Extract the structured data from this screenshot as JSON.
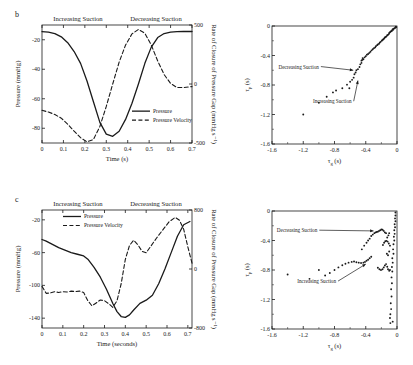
{
  "figure": {
    "panels": [
      {
        "id": "b",
        "label": "b",
        "headers": {
          "left": "Increasing Suction",
          "right": "Decreasing Suction"
        },
        "legend": [
          {
            "label": "Pressure",
            "style": "solid"
          },
          {
            "label": "Pressure Velocity",
            "style": "dashed"
          }
        ]
      },
      {
        "id": "c",
        "label": "c",
        "headers": {
          "left": "Increasing Suction",
          "right": "Decreasing Suction"
        },
        "legend": [
          {
            "label": "Pressure",
            "style": "solid"
          },
          {
            "label": "Pressure Velocity",
            "style": "dashed"
          }
        ]
      }
    ]
  },
  "chart_data": [
    {
      "id": "panel-b-timeseries",
      "type": "line",
      "title": "",
      "xlabel": "Time (s)",
      "ylabel": "Pressure (mmHg)",
      "y2label": "Rate of Closure of Pressure Gap (mmHg s⁻¹)",
      "xlim": [
        0,
        0.7
      ],
      "ylim": [
        -90,
        -10
      ],
      "y2lim": [
        -500,
        500
      ],
      "xticks": [
        0,
        0.1,
        0.2,
        0.3,
        0.4,
        0.5,
        0.6,
        0.7
      ],
      "xticklabels": [
        "0",
        "0.1",
        "0.2",
        "0.3",
        "0.4",
        "0.5",
        "0.6",
        "0.7"
      ],
      "yticks": [
        -20,
        -40,
        -60,
        -80
      ],
      "yticklabels": [
        "-20",
        "-40",
        "-60",
        "-80"
      ],
      "y2ticks": [
        500,
        0,
        -500
      ],
      "y2ticklabels": [
        "500",
        "0",
        "-500"
      ],
      "grid": false,
      "legend_position": "lower-right",
      "series": [
        {
          "name": "Pressure",
          "style": "solid",
          "axis": "left",
          "x": [
            0.0,
            0.03,
            0.06,
            0.09,
            0.12,
            0.15,
            0.18,
            0.21,
            0.24,
            0.27,
            0.3,
            0.33,
            0.36,
            0.39,
            0.42,
            0.45,
            0.48,
            0.51,
            0.54,
            0.57,
            0.6,
            0.63,
            0.66,
            0.7
          ],
          "y": [
            -14.5,
            -14.8,
            -15.8,
            -18.0,
            -22.0,
            -28.0,
            -36.0,
            -48.0,
            -62.0,
            -76.0,
            -84.0,
            -85.5,
            -82.0,
            -74.0,
            -63.0,
            -50.0,
            -36.0,
            -25.0,
            -18.5,
            -15.8,
            -14.8,
            -14.5,
            -14.4,
            -14.4
          ]
        },
        {
          "name": "Pressure Velocity",
          "style": "dashed",
          "axis": "right",
          "x": [
            0.0,
            0.03,
            0.06,
            0.09,
            0.12,
            0.15,
            0.18,
            0.21,
            0.24,
            0.27,
            0.3,
            0.33,
            0.36,
            0.39,
            0.42,
            0.45,
            0.48,
            0.51,
            0.54,
            0.57,
            0.6,
            0.63,
            0.66,
            0.7
          ],
          "y": [
            -223,
            -238,
            -258,
            -290,
            -340,
            -400,
            -455,
            -490,
            -470,
            -360,
            -190,
            0,
            185,
            330,
            425,
            462,
            430,
            330,
            195,
            80,
            5,
            -30,
            -30,
            -22
          ]
        }
      ]
    },
    {
      "id": "panel-b-scatter",
      "type": "scatter",
      "title": "",
      "xlabel": "τ_g (s)",
      "ylabel": "τ_p (s)",
      "xlim": [
        -1.6,
        0
      ],
      "ylim": [
        -1.6,
        0
      ],
      "xticks": [
        -1.6,
        -1.2,
        -0.8,
        -0.4,
        0
      ],
      "xticklabels": [
        "-1.6",
        "-1.2",
        "-0.8",
        "-0.4",
        "0"
      ],
      "yticks": [
        0,
        -0.4,
        -0.8,
        -1.2,
        -1.6
      ],
      "yticklabels": [
        "0",
        "-0.4",
        "-0.8",
        "-1.2",
        "-1.6"
      ],
      "grid": false,
      "annotations": [
        {
          "text": "Decreasing Suction",
          "x": -1.0,
          "y": -0.55,
          "arrow_to": [
            -0.56,
            -0.6
          ]
        },
        {
          "text": "Increasing Suction",
          "x": -0.58,
          "y": -1.02,
          "arrow_to": [
            -0.5,
            -0.74
          ]
        }
      ],
      "points": [
        [
          -0.02,
          -0.02
        ],
        [
          -0.03,
          -0.03
        ],
        [
          -0.04,
          -0.035
        ],
        [
          -0.05,
          -0.05
        ],
        [
          -0.055,
          -0.045
        ],
        [
          -0.065,
          -0.06
        ],
        [
          -0.07,
          -0.07
        ],
        [
          -0.08,
          -0.075
        ],
        [
          -0.09,
          -0.085
        ],
        [
          -0.1,
          -0.095
        ],
        [
          -0.105,
          -0.11
        ],
        [
          -0.115,
          -0.12
        ],
        [
          -0.125,
          -0.125
        ],
        [
          -0.135,
          -0.14
        ],
        [
          -0.145,
          -0.15
        ],
        [
          -0.155,
          -0.155
        ],
        [
          -0.165,
          -0.17
        ],
        [
          -0.175,
          -0.18
        ],
        [
          -0.185,
          -0.19
        ],
        [
          -0.195,
          -0.2
        ],
        [
          -0.21,
          -0.215
        ],
        [
          -0.22,
          -0.225
        ],
        [
          -0.23,
          -0.24
        ],
        [
          -0.245,
          -0.25
        ],
        [
          -0.255,
          -0.26
        ],
        [
          -0.27,
          -0.275
        ],
        [
          -0.28,
          -0.29
        ],
        [
          -0.295,
          -0.3
        ],
        [
          -0.31,
          -0.315
        ],
        [
          -0.325,
          -0.33
        ],
        [
          -0.34,
          -0.35
        ],
        [
          -0.355,
          -0.365
        ],
        [
          -0.37,
          -0.38
        ],
        [
          -0.385,
          -0.39
        ],
        [
          -0.4,
          -0.41
        ],
        [
          -0.415,
          -0.425
        ],
        [
          -0.43,
          -0.45
        ],
        [
          -0.445,
          -0.46
        ],
        [
          -0.455,
          -0.5
        ],
        [
          -0.47,
          -0.52
        ],
        [
          -0.48,
          -0.555
        ],
        [
          -0.5,
          -0.585
        ],
        [
          -0.52,
          -0.6
        ],
        [
          -0.53,
          -0.63
        ],
        [
          -0.545,
          -0.655
        ],
        [
          -0.555,
          -0.7
        ],
        [
          -0.575,
          -0.73
        ],
        [
          -0.6,
          -0.755
        ],
        [
          -0.64,
          -0.795
        ],
        [
          -0.7,
          -0.845
        ],
        [
          -0.78,
          -0.875
        ],
        [
          -0.82,
          -0.9
        ],
        [
          -0.9,
          -0.96
        ],
        [
          -1.0,
          -1.04
        ],
        [
          -1.2,
          -1.2
        ],
        [
          -0.61,
          -0.845
        ],
        [
          -0.455,
          -0.47
        ],
        [
          -0.44,
          -0.435
        ],
        [
          -0.015,
          -0.01
        ],
        [
          -0.01,
          -0.015
        ]
      ]
    },
    {
      "id": "panel-c-timeseries",
      "type": "line",
      "title": "",
      "xlabel": "Time (seconds)",
      "ylabel": "Pressure (mmHg)",
      "y2label": "Rate of Closure of Pressure Gap (mmHg s⁻¹)",
      "xlim": [
        0,
        0.72
      ],
      "ylim": [
        -152,
        -8
      ],
      "y2lim": [
        -800,
        800
      ],
      "xticks": [
        0,
        0.1,
        0.2,
        0.3,
        0.4,
        0.5,
        0.6,
        0.7
      ],
      "xticklabels": [
        "0",
        "0.1",
        "0.2",
        "0.3",
        "0.4",
        "0.5",
        "0.6",
        "0.7"
      ],
      "yticks": [
        -20,
        -60,
        -100,
        -140
      ],
      "yticklabels": [
        "-20",
        "-60",
        "-100",
        "-140"
      ],
      "y2ticks": [
        800,
        0,
        -800
      ],
      "y2ticklabels": [
        "800",
        "0",
        "-800"
      ],
      "grid": false,
      "legend_position": "upper-left",
      "series": [
        {
          "name": "Pressure",
          "style": "solid",
          "axis": "left",
          "x": [
            0.0,
            0.02,
            0.05,
            0.08,
            0.11,
            0.14,
            0.17,
            0.2,
            0.22,
            0.25,
            0.28,
            0.31,
            0.34,
            0.36,
            0.38,
            0.4,
            0.42,
            0.44,
            0.47,
            0.5,
            0.53,
            0.56,
            0.59,
            0.62,
            0.65,
            0.68,
            0.71
          ],
          "y": [
            -44,
            -46,
            -50,
            -54,
            -57,
            -60,
            -62,
            -64,
            -68,
            -78,
            -90,
            -105,
            -122,
            -132,
            -138,
            -139,
            -136,
            -130,
            -122,
            -118,
            -112,
            -98,
            -80,
            -60,
            -40,
            -26,
            -22
          ]
        },
        {
          "name": "Pressure Velocity",
          "style": "dashed",
          "axis": "right",
          "x": [
            0.0,
            0.02,
            0.04,
            0.06,
            0.08,
            0.1,
            0.12,
            0.14,
            0.16,
            0.18,
            0.2,
            0.22,
            0.24,
            0.26,
            0.28,
            0.3,
            0.32,
            0.34,
            0.36,
            0.38,
            0.4,
            0.42,
            0.44,
            0.46,
            0.48,
            0.5,
            0.52,
            0.55,
            0.58,
            0.61,
            0.64,
            0.66,
            0.68,
            0.7,
            0.72
          ],
          "y": [
            -236,
            -330,
            -325,
            -308,
            -318,
            -308,
            -312,
            -300,
            -306,
            -300,
            -320,
            -430,
            -500,
            -460,
            -420,
            -430,
            -470,
            -520,
            -430,
            -200,
            130,
            320,
            390,
            330,
            240,
            220,
            300,
            420,
            530,
            640,
            700,
            660,
            540,
            300,
            80
          ]
        }
      ]
    },
    {
      "id": "panel-c-scatter",
      "type": "scatter",
      "title": "",
      "xlabel": "τ_g (s)",
      "ylabel": "τ_p (s)",
      "xlim": [
        -1.6,
        0
      ],
      "ylim": [
        -1.6,
        0
      ],
      "xticks": [
        -1.6,
        -1.2,
        -0.8,
        -0.4,
        0
      ],
      "xticklabels": [
        "-1.6",
        "-1.2",
        "-0.8",
        "-0.4",
        "0"
      ],
      "yticks": [
        0,
        -0.4,
        -0.8,
        -1.2,
        -1.6
      ],
      "yticklabels": [
        "0",
        "-0.4",
        "-0.8",
        "-1.2",
        "-1.6"
      ],
      "grid": false,
      "annotations": [
        {
          "text": "Decreasing Suction",
          "x": -1.02,
          "y": -0.26,
          "arrow_to": [
            -0.3,
            -0.27
          ]
        },
        {
          "text": "Increasing Suction",
          "x": -0.78,
          "y": -0.95,
          "arrow_to": [
            -0.4,
            -0.72
          ]
        }
      ],
      "points": [
        [
          -0.02,
          -0.02
        ],
        [
          -0.02,
          -0.06
        ],
        [
          -0.025,
          -0.1
        ],
        [
          -0.02,
          -0.14
        ],
        [
          -0.03,
          -0.18
        ],
        [
          -0.025,
          -0.22
        ],
        [
          -0.035,
          -0.26
        ],
        [
          -0.03,
          -0.31
        ],
        [
          -0.04,
          -0.35
        ],
        [
          -0.035,
          -0.4
        ],
        [
          -0.045,
          -0.45
        ],
        [
          -0.05,
          -0.52
        ],
        [
          -0.045,
          -0.58
        ],
        [
          -0.06,
          -0.64
        ],
        [
          -0.055,
          -0.7
        ],
        [
          -0.065,
          -0.76
        ],
        [
          -0.06,
          -0.82
        ],
        [
          -0.07,
          -0.9
        ],
        [
          -0.065,
          -0.98
        ],
        [
          -0.075,
          -1.06
        ],
        [
          -0.07,
          -1.16
        ],
        [
          -0.08,
          -1.25
        ],
        [
          -0.075,
          -1.33
        ],
        [
          -0.085,
          -1.4
        ],
        [
          -0.09,
          -1.45
        ],
        [
          -0.1,
          -0.3
        ],
        [
          -0.11,
          -0.33
        ],
        [
          -0.125,
          -0.36
        ],
        [
          -0.14,
          -0.3
        ],
        [
          -0.155,
          -0.29
        ],
        [
          -0.17,
          -0.27
        ],
        [
          -0.185,
          -0.255
        ],
        [
          -0.2,
          -0.25
        ],
        [
          -0.215,
          -0.26
        ],
        [
          -0.23,
          -0.27
        ],
        [
          -0.245,
          -0.28
        ],
        [
          -0.26,
          -0.285
        ],
        [
          -0.275,
          -0.29
        ],
        [
          -0.29,
          -0.3
        ],
        [
          -0.31,
          -0.32
        ],
        [
          -0.33,
          -0.34
        ],
        [
          -0.35,
          -0.375
        ],
        [
          -0.37,
          -0.4
        ],
        [
          -0.39,
          -0.43
        ],
        [
          -0.42,
          -0.47
        ],
        [
          -0.45,
          -0.52
        ],
        [
          -0.33,
          -0.62
        ],
        [
          -0.35,
          -0.64
        ],
        [
          -0.37,
          -0.66
        ],
        [
          -0.39,
          -0.675
        ],
        [
          -0.41,
          -0.69
        ],
        [
          -0.43,
          -0.7
        ],
        [
          -0.46,
          -0.705
        ],
        [
          -0.49,
          -0.7
        ],
        [
          -0.52,
          -0.695
        ],
        [
          -0.55,
          -0.685
        ],
        [
          -0.58,
          -0.69
        ],
        [
          -0.62,
          -0.7
        ],
        [
          -0.66,
          -0.715
        ],
        [
          -0.7,
          -0.735
        ],
        [
          -0.75,
          -0.765
        ],
        [
          -0.8,
          -0.8
        ],
        [
          -0.86,
          -0.84
        ],
        [
          -0.92,
          -0.875
        ],
        [
          -1.0,
          -0.8
        ],
        [
          -1.12,
          -0.92
        ],
        [
          -1.4,
          -0.86
        ],
        [
          -0.245,
          -0.77
        ],
        [
          -0.225,
          -0.79
        ],
        [
          -0.205,
          -0.8
        ],
        [
          -0.185,
          -0.79
        ],
        [
          -0.17,
          -0.765
        ],
        [
          -0.155,
          -0.74
        ],
        [
          -0.14,
          -0.72
        ],
        [
          -0.125,
          -0.755
        ],
        [
          -0.115,
          -0.79
        ],
        [
          -0.1,
          -0.81
        ],
        [
          -0.09,
          -0.8
        ],
        [
          -0.115,
          -0.6
        ],
        [
          -0.13,
          -0.58
        ],
        [
          -0.1,
          -0.55
        ],
        [
          -0.09,
          -0.47
        ],
        [
          -0.105,
          -0.44
        ],
        [
          -0.12,
          -0.415
        ],
        [
          -0.135,
          -0.405
        ],
        [
          -0.15,
          -0.41
        ],
        [
          -0.165,
          -0.43
        ],
        [
          -0.18,
          -0.46
        ],
        [
          -0.055,
          -1.5
        ],
        [
          -0.085,
          -1.52
        ]
      ]
    }
  ]
}
